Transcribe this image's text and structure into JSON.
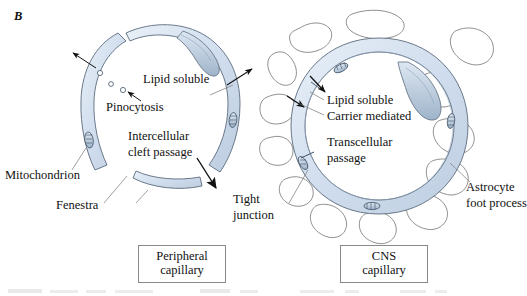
{
  "figure": {
    "panel_label": "B",
    "background": "#ffffff",
    "wall_fill": "#cfdced",
    "wall_fill_light": "#e3ecf5",
    "outline": "#5b6b7d",
    "organelle_fill": "#b9cadd",
    "ink": "#111111"
  },
  "peripheral": {
    "box_line1": "Peripheral",
    "box_line2": "capillary",
    "labels": {
      "pinocytosis": "Pinocytosis",
      "lipid_soluble": "Lipid soluble",
      "intercellular_line1": "Intercellular",
      "intercellular_line2": "cleft passage",
      "mitochondrion": "Mitochondrion",
      "fenestra": "Fenestra"
    }
  },
  "cns": {
    "box_line1": "CNS",
    "box_line2": "capillary",
    "labels": {
      "lipid_soluble": "Lipid soluble",
      "carrier_mediated": "Carrier mediated",
      "transcellular_line1": "Transcellular",
      "transcellular_line2": "passage",
      "tight_line1": "Tight",
      "tight_line2": "junction",
      "astrocyte_line1": "Astrocyte",
      "astrocyte_line2": "foot process"
    }
  },
  "caption": {
    "text": "Figure  Blood-brain barrier: peripheral capillary versus CNS capillary"
  }
}
